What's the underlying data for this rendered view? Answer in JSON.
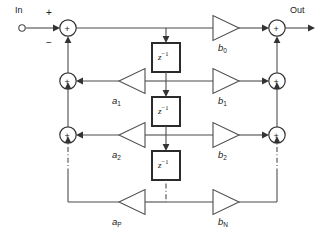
{
  "diagram": {
    "type": "block-diagram",
    "colors": {
      "wire": "#4d4d4d",
      "node_stroke": "#333333",
      "delay_border": "#2b2b2b",
      "background": "#ffffff",
      "text": "#1a1a1a"
    },
    "terminals": {
      "input_label": "In",
      "output_label": "Out"
    },
    "signs": {
      "input_plus": "+",
      "input_minus": "−"
    },
    "summing_nodes": [
      {
        "name": "input-summer",
        "symbol": "+",
        "side": "left",
        "row": 0
      },
      {
        "name": "output-summer",
        "symbol": "+",
        "side": "right",
        "row": 0
      },
      {
        "name": "feedback-summer-1",
        "symbol": "+",
        "side": "left",
        "row": 1
      },
      {
        "name": "feedforward-summer-1",
        "symbol": "+",
        "side": "right",
        "row": 1
      },
      {
        "name": "feedback-summer-2",
        "symbol": "+",
        "side": "left",
        "row": 2
      },
      {
        "name": "feedforward-summer-2",
        "symbol": "+",
        "side": "right",
        "row": 2
      }
    ],
    "delays": [
      {
        "name": "delay-1",
        "base": "z",
        "exponent": "−1"
      },
      {
        "name": "delay-2",
        "base": "z",
        "exponent": "−1"
      },
      {
        "name": "delay-3",
        "base": "z",
        "exponent": "−1"
      }
    ],
    "feedback_gains": [
      {
        "name": "a1",
        "base": "a",
        "sub": "1",
        "direction": "left"
      },
      {
        "name": "a2",
        "base": "a",
        "sub": "2",
        "direction": "left"
      },
      {
        "name": "aP",
        "base": "a",
        "sub": "P",
        "direction": "left"
      }
    ],
    "feedforward_gains": [
      {
        "name": "b0",
        "base": "b",
        "sub": "0",
        "direction": "right"
      },
      {
        "name": "b1",
        "base": "b",
        "sub": "1",
        "direction": "right"
      },
      {
        "name": "b2",
        "base": "b",
        "sub": "2",
        "direction": "right"
      },
      {
        "name": "bN",
        "base": "b",
        "sub": "N",
        "direction": "right"
      }
    ],
    "continuation": {
      "style": "dash-dot",
      "note": "vertical dash-dot segments indicate omitted intermediate stages"
    }
  }
}
